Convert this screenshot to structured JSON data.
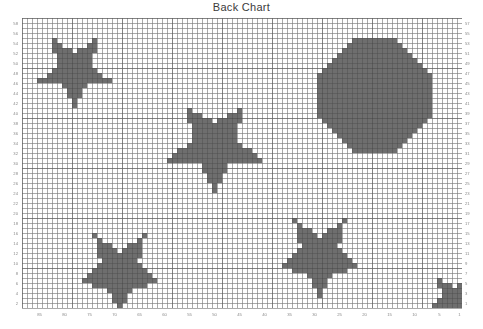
{
  "chart_title": "Back Chart",
  "chart_data": {
    "type": "heatmap",
    "title": "Back Chart",
    "subtitle": "",
    "xlabel": "",
    "ylabel": "",
    "grid": true,
    "legend_position": "none",
    "cell_size_px": 5,
    "grid_columns": 88,
    "grid_rows": 58,
    "major_gridline_every": 10,
    "fill_color": "#6e6e6e",
    "minor_grid_color": "#d8d8d8",
    "major_grid_color": "#a8a8a8",
    "background_color": "#ffffff",
    "axes": {
      "left": {
        "orientation": "vertical",
        "direction": "descending",
        "parity": "even",
        "values": [
          58,
          56,
          54,
          52,
          50,
          48,
          46,
          44,
          42,
          40,
          38,
          36,
          34,
          32,
          30,
          28,
          26,
          24,
          22,
          20,
          18,
          16,
          14,
          12,
          10,
          8,
          6,
          4,
          2
        ]
      },
      "right": {
        "orientation": "vertical",
        "direction": "descending",
        "parity": "odd",
        "values": [
          57,
          55,
          53,
          51,
          49,
          47,
          45,
          43,
          41,
          39,
          37,
          35,
          33,
          31,
          29,
          27,
          25,
          23,
          21,
          19,
          17,
          15,
          13,
          11,
          9,
          7,
          5,
          3,
          1
        ]
      },
      "bottom": {
        "orientation": "horizontal",
        "direction": "descending",
        "values": [
          85,
          80,
          75,
          70,
          65,
          60,
          55,
          50,
          45,
          40,
          35,
          30,
          25,
          20,
          15,
          10,
          5,
          1
        ]
      }
    },
    "motifs": [
      {
        "name": "star-top-left",
        "shape": "star5",
        "center_col": 10,
        "center_row": 10,
        "radius_cells": 8,
        "fill": "#6e6e6e"
      },
      {
        "name": "star-upper-middle",
        "shape": "star5",
        "center_col": 38,
        "center_row": 25,
        "radius_cells": 10,
        "fill": "#6e6e6e"
      },
      {
        "name": "octagon-top-right",
        "shape": "octagon",
        "center_col": 70,
        "center_row": 15,
        "radius_cells": 12,
        "fill": "#6e6e6e"
      },
      {
        "name": "star-bottom-left",
        "shape": "star5",
        "center_col": 19,
        "center_row": 50,
        "radius_cells": 9,
        "fill": "#6e6e6e"
      },
      {
        "name": "star-bottom-middle",
        "shape": "star5",
        "center_col": 59,
        "center_row": 47,
        "radius_cells": 9,
        "fill": "#6e6e6e"
      },
      {
        "name": "star-bottom-right",
        "shape": "star5",
        "center_col": 86,
        "center_row": 56,
        "radius_cells": 6,
        "fill": "#6e6e6e"
      }
    ]
  }
}
